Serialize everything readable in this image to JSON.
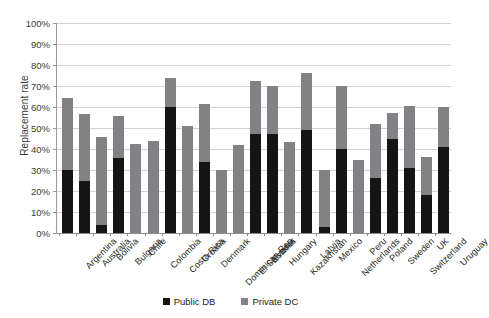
{
  "chart_data": {
    "type": "bar",
    "title": "",
    "subtitle": "",
    "xlabel": "",
    "ylabel": "Replacement rate",
    "ylim": [
      0,
      100
    ],
    "ytick_labels": [
      "100%",
      "90%",
      "80%",
      "70%",
      "60%",
      "50%",
      "40%",
      "30%",
      "20%",
      "10%",
      "0%"
    ],
    "ytick_values": [
      100,
      90,
      80,
      70,
      60,
      50,
      40,
      30,
      20,
      10,
      0
    ],
    "grid": true,
    "stacked": true,
    "legend_position": "bottom",
    "categories": [
      "Argentina",
      "Australia",
      "Bolivia",
      "Bulgaria",
      "Chile",
      "Colombia",
      "Costa Rica",
      "Croatia",
      "Denmark",
      "Dominican Rep",
      "El Salvador",
      "Estonia",
      "Hungary",
      "Kazakhstan",
      "Latvia",
      "Mexico",
      "Netherlands",
      "Peru",
      "Poland",
      "Sweden",
      "Switzerland",
      "UK",
      "Uruguay"
    ],
    "series": [
      {
        "name": "Public DB",
        "color": "#151515",
        "values": [
          30,
          25,
          4,
          35.5,
          0,
          0,
          60,
          0,
          34,
          0,
          0,
          47,
          47,
          0,
          49,
          3,
          40,
          0,
          26,
          45,
          31,
          18,
          41
        ]
      },
      {
        "name": "Private DC",
        "color": "#808285",
        "values": [
          34.5,
          31.5,
          41.5,
          20,
          42.5,
          44,
          14,
          51,
          27.5,
          30,
          42,
          25.5,
          23,
          43.5,
          27,
          27,
          30,
          35,
          26,
          12,
          29.5,
          18,
          19
        ]
      }
    ],
    "totals": [
      64.5,
      56.5,
      45.5,
      55.5,
      42.5,
      44,
      74,
      51,
      61.5,
      30,
      42,
      72.5,
      70,
      43.5,
      76,
      30,
      70,
      35,
      52,
      57,
      60.5,
      36,
      60
    ]
  },
  "legend": {
    "items": [
      {
        "label": "Public DB",
        "color": "#151515"
      },
      {
        "label": "Private DC",
        "color": "#808285"
      }
    ]
  }
}
